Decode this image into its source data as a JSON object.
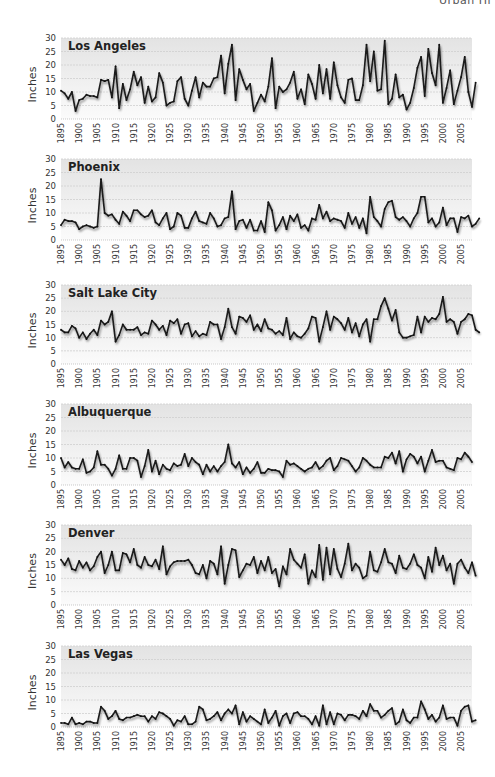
{
  "header": {
    "text": "Urban Hi"
  },
  "chart_data": [
    {
      "type": "line",
      "title": "Los Angeles",
      "xlabel": "",
      "ylabel": "Inches",
      "ylim": [
        0,
        30
      ],
      "yticks": [
        0,
        5,
        10,
        15,
        20,
        25,
        30
      ],
      "xlim": [
        1895,
        2008
      ],
      "xticks": [
        1895,
        1900,
        1905,
        1910,
        1915,
        1920,
        1925,
        1930,
        1935,
        1940,
        1945,
        1950,
        1955,
        1960,
        1965,
        1970,
        1975,
        1980,
        1985,
        1990,
        1995,
        2000,
        2005
      ],
      "grid": true,
      "x_start": 1895,
      "values": [
        10.5,
        9.5,
        7.5,
        10,
        3,
        7,
        7.5,
        9,
        8.5,
        8.5,
        8,
        14.5,
        14,
        14.5,
        8,
        19.5,
        4,
        13,
        7,
        11,
        17.5,
        12.5,
        15.5,
        6,
        12,
        6.5,
        8,
        17,
        13.5,
        5,
        6,
        6.5,
        14,
        15.5,
        7.5,
        5,
        10.5,
        15.5,
        8,
        13.5,
        12,
        12,
        15,
        15.5,
        23.5,
        9.5,
        20.5,
        27.5,
        7,
        18.5,
        14.5,
        11,
        13,
        3,
        6,
        9,
        6.5,
        12,
        22.5,
        4,
        12,
        10,
        11,
        13.5,
        17.5,
        7.5,
        11,
        5.5,
        16.5,
        13,
        7.5,
        20,
        9.5,
        18.5,
        7.5,
        21,
        12.5,
        8,
        6,
        14.5,
        15,
        7,
        7,
        12.5,
        27.5,
        14,
        25,
        10.5,
        11,
        29,
        5.5,
        7.5,
        16.5,
        8,
        9,
        3.5,
        6,
        11.5,
        19,
        23,
        8.5,
        26,
        17,
        12.5,
        27.5,
        6,
        11.5,
        18,
        5.5,
        10.5,
        15.5,
        23,
        10,
        4.5,
        13.5
      ]
    },
    {
      "type": "line",
      "title": "Phoenix",
      "xlabel": "",
      "ylabel": "Inches",
      "ylim": [
        0,
        30
      ],
      "yticks": [
        0,
        5,
        10,
        15,
        20,
        25,
        30
      ],
      "xlim": [
        1895,
        2008
      ],
      "xticks": [
        1895,
        1900,
        1905,
        1910,
        1915,
        1920,
        1925,
        1930,
        1935,
        1940,
        1945,
        1950,
        1955,
        1960,
        1965,
        1970,
        1975,
        1980,
        1985,
        1990,
        1995,
        2000,
        2005
      ],
      "grid": true,
      "x_start": 1895,
      "values": [
        5.5,
        7.5,
        7,
        7,
        6.5,
        4,
        5,
        5.5,
        5,
        4.5,
        5,
        22.5,
        10,
        9,
        9.5,
        7.5,
        6,
        10.5,
        9,
        7,
        11,
        11,
        9.5,
        8.5,
        9,
        11,
        6.5,
        5.5,
        8,
        10,
        4,
        5,
        10,
        9,
        4.5,
        4.5,
        8,
        10.5,
        7,
        6.5,
        6,
        10,
        8,
        5,
        5.5,
        8,
        8.5,
        18,
        4,
        7,
        7.5,
        4.5,
        7.5,
        3.5,
        3.5,
        7,
        3,
        14,
        11,
        3.5,
        5.5,
        8.5,
        4,
        9,
        7,
        9.5,
        4.5,
        5.5,
        3.5,
        8,
        7.5,
        13,
        8,
        10.5,
        7,
        8,
        7.5,
        7,
        4.5,
        10,
        6,
        8.5,
        4.5,
        8,
        2.5,
        16,
        8.5,
        7,
        5,
        11.5,
        14,
        14.5,
        8.5,
        7.5,
        8.5,
        7,
        5,
        8,
        10,
        16,
        16,
        6.5,
        8,
        5,
        6.5,
        12,
        5.5,
        8,
        8,
        3,
        8.5,
        8,
        9,
        5,
        6,
        8
      ]
    },
    {
      "type": "line",
      "title": "Salt Lake City",
      "xlabel": "",
      "ylabel": "Inches",
      "ylim": [
        0,
        30
      ],
      "yticks": [
        0,
        5,
        10,
        15,
        20,
        25,
        30
      ],
      "xlim": [
        1895,
        2008
      ],
      "xticks": [
        1895,
        1900,
        1905,
        1910,
        1915,
        1920,
        1925,
        1930,
        1935,
        1940,
        1945,
        1950,
        1955,
        1960,
        1965,
        1970,
        1975,
        1980,
        1985,
        1990,
        1995,
        2000,
        2005
      ],
      "grid": true,
      "x_start": 1895,
      "values": [
        13,
        12,
        12,
        14.5,
        13.5,
        10,
        12,
        9.5,
        11.5,
        13,
        11,
        16.5,
        15,
        16,
        20,
        8.5,
        11,
        15,
        13,
        13,
        13,
        14,
        11,
        12,
        11.5,
        16.5,
        15,
        13,
        14.5,
        11,
        16.5,
        15.5,
        17,
        11.5,
        15,
        15.5,
        10.5,
        12.5,
        10.5,
        11.5,
        11,
        16,
        15,
        15,
        9.5,
        14,
        21,
        14,
        11.5,
        18,
        17.5,
        16,
        18.5,
        13,
        15,
        12.5,
        17,
        13.5,
        13,
        11.5,
        12.5,
        11,
        17.5,
        9.5,
        12,
        10.5,
        10,
        11.5,
        13.5,
        18,
        17.5,
        8.5,
        14,
        20,
        13,
        18,
        17,
        15.5,
        13,
        17.5,
        12,
        15.5,
        10.5,
        15,
        17,
        8.5,
        17,
        17,
        22,
        25,
        21,
        16.5,
        20.5,
        12,
        10,
        10,
        10.5,
        11,
        18,
        12,
        18,
        16,
        17.5,
        17,
        19,
        25.5,
        16,
        17,
        16,
        11.5,
        16,
        17,
        19,
        18.5,
        13,
        12
      ]
    },
    {
      "type": "line",
      "title": "Albuquerque",
      "xlabel": "",
      "ylabel": "Inches",
      "ylim": [
        0,
        30
      ],
      "yticks": [
        0,
        5,
        10,
        15,
        20,
        25,
        30
      ],
      "xlim": [
        1895,
        2008
      ],
      "xticks": [
        1895,
        1900,
        1905,
        1910,
        1915,
        1920,
        1925,
        1930,
        1935,
        1940,
        1945,
        1950,
        1955,
        1960,
        1965,
        1970,
        1975,
        1980,
        1985,
        1990,
        1995,
        2000,
        2005
      ],
      "grid": true,
      "x_start": 1895,
      "values": [
        10,
        6.5,
        8.5,
        6.5,
        6,
        6,
        9.5,
        4.5,
        5,
        6.5,
        12.5,
        7.5,
        7.5,
        6,
        3.5,
        6,
        11,
        6,
        6,
        10,
        10,
        9,
        3,
        7,
        13,
        5,
        9,
        4,
        7.5,
        6,
        5.5,
        8,
        7,
        7.5,
        11.5,
        7,
        10,
        8.5,
        7.5,
        4,
        7.5,
        5,
        7,
        5,
        7,
        8.5,
        15,
        8,
        6.5,
        8.5,
        4,
        6.5,
        4.5,
        6,
        8.5,
        4.5,
        4.5,
        6,
        5.5,
        5.5,
        5,
        3,
        9,
        7.5,
        8,
        7,
        6,
        5,
        6,
        6.5,
        8.5,
        6,
        7,
        9,
        10,
        5.5,
        7,
        10,
        9.5,
        9,
        7,
        5,
        6.5,
        10,
        9,
        7.5,
        6.5,
        6.5,
        6.5,
        10.5,
        10,
        12,
        8,
        12.5,
        5,
        9.5,
        11.5,
        10.5,
        8,
        10.5,
        5,
        9,
        13,
        8.5,
        9,
        9,
        6.5,
        6,
        5.5,
        10,
        9.5,
        12,
        10.5,
        8.5
      ]
    },
    {
      "type": "line",
      "title": "Denver",
      "xlabel": "",
      "ylabel": "Inches",
      "ylim": [
        0,
        30
      ],
      "yticks": [
        0,
        5,
        10,
        15,
        20,
        25,
        30
      ],
      "xlim": [
        1895,
        2008
      ],
      "xticks": [
        1895,
        1900,
        1905,
        1910,
        1915,
        1920,
        1925,
        1930,
        1935,
        1940,
        1945,
        1950,
        1955,
        1960,
        1965,
        1970,
        1975,
        1980,
        1985,
        1990,
        1995,
        2000,
        2005
      ],
      "grid": true,
      "x_start": 1895,
      "values": [
        17,
        15,
        17.5,
        13.5,
        13,
        16.5,
        14,
        16,
        13,
        14.5,
        18,
        20,
        12,
        15,
        20,
        13,
        13,
        19.5,
        19,
        16,
        21,
        15,
        14,
        18,
        15,
        14.5,
        17,
        13.5,
        22,
        11.5,
        14.5,
        16,
        16.5,
        16.5,
        16.5,
        17,
        15,
        12,
        11.5,
        15,
        10,
        16.5,
        15.5,
        11.5,
        22,
        8,
        15,
        21,
        20.5,
        10.5,
        13,
        15.5,
        15,
        18,
        12,
        16.5,
        13,
        18,
        12,
        13.5,
        7,
        14.5,
        11.5,
        21,
        17,
        15.5,
        14,
        19,
        8,
        13,
        10.5,
        22.5,
        9.5,
        21.5,
        11.5,
        21,
        13.5,
        10.5,
        15.5,
        23,
        13,
        15.5,
        14,
        10,
        11,
        20,
        13,
        12.5,
        16,
        21,
        16,
        15.5,
        12,
        18.5,
        14,
        13.5,
        15.5,
        19,
        15,
        14,
        10,
        18,
        12.5,
        21.5,
        15,
        18.5,
        13,
        15.5,
        8,
        15.5,
        17,
        14,
        12,
        16,
        11
      ]
    },
    {
      "type": "line",
      "title": "Las Vegas",
      "xlabel": "",
      "ylabel": "Inches",
      "ylim": [
        0,
        30
      ],
      "yticks": [
        0,
        5,
        10,
        15,
        20,
        25,
        30
      ],
      "xlim": [
        1895,
        2008
      ],
      "xticks": [
        1895,
        1900,
        1905,
        1910,
        1915,
        1920,
        1925,
        1930,
        1935,
        1940,
        1945,
        1950,
        1955,
        1960,
        1965,
        1970,
        1975,
        1980,
        1985,
        1990,
        1995,
        2000,
        2005
      ],
      "grid": true,
      "x_start": 1895,
      "values": [
        1.5,
        1.5,
        1,
        3.5,
        1,
        1.5,
        1,
        2,
        2,
        1.5,
        1.5,
        7.5,
        6,
        3,
        4,
        6,
        3,
        2.5,
        3.5,
        3.5,
        4,
        4.5,
        4,
        4,
        2,
        4,
        3,
        5.5,
        5,
        4,
        3,
        0.5,
        2.5,
        2,
        4,
        1,
        1,
        2,
        7.5,
        6.5,
        2.5,
        3,
        4,
        5.5,
        2.5,
        5,
        6.5,
        5,
        8,
        1,
        5.5,
        2,
        4,
        3,
        2,
        1,
        6.5,
        1.5,
        3.5,
        6,
        0.5,
        4,
        5,
        1.5,
        5,
        5.5,
        4,
        4,
        3,
        1,
        4,
        0.5,
        8,
        1,
        5.5,
        1,
        5,
        4.5,
        2.5,
        4.5,
        4.5,
        4,
        3,
        6,
        4,
        8.5,
        6,
        6,
        3.5,
        4.5,
        6,
        7,
        1,
        2,
        6.5,
        2.5,
        1.5,
        3.5,
        3.5,
        9.5,
        6.5,
        3,
        4.5,
        2,
        3.5,
        8,
        3,
        3.5,
        3.5,
        0.5,
        6,
        7.5,
        8,
        2,
        2.5
      ]
    }
  ]
}
